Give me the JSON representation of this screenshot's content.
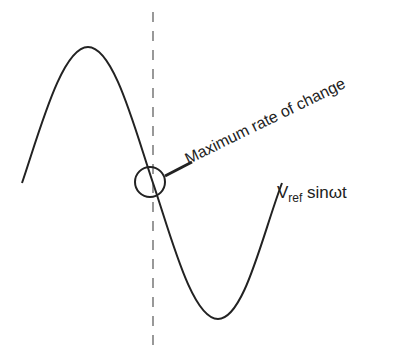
{
  "diagram": {
    "annotation": "Maximum rate of change",
    "signal_label": {
      "symbol": "V",
      "subscript": "ref",
      "function": "sinωt"
    },
    "colors": {
      "stroke": "#222222",
      "dashed": "#555555",
      "background": "#ffffff"
    }
  }
}
